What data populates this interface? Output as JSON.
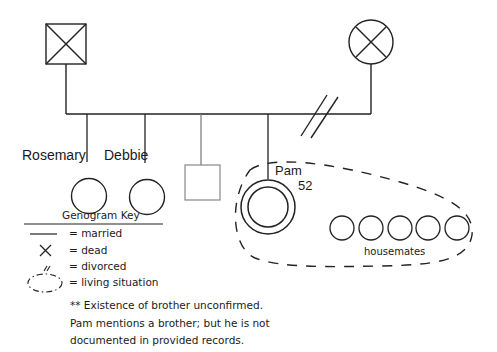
{
  "diagram": {
    "type": "genogram",
    "parents": {
      "father": {
        "symbol": "square-x",
        "status": "dead"
      },
      "mother": {
        "symbol": "circle-x",
        "status": "dead"
      },
      "relationship": "divorced"
    },
    "children": [
      {
        "name": "Rosemary",
        "symbol": "circle"
      },
      {
        "name": "Debbie",
        "symbol": "circle"
      },
      {
        "name": "",
        "symbol": "square",
        "note": "unconfirmed brother"
      },
      {
        "name": "Pam",
        "age": "52",
        "symbol": "double-circle"
      }
    ],
    "housemates": {
      "count": 5,
      "label": "housemates"
    }
  },
  "labels": {
    "rosemary": "Rosemary",
    "debbie": "Debbie",
    "pam": "Pam",
    "pam_age": "52",
    "housemates": "housemates"
  },
  "key": {
    "title": "Genogram Key",
    "items": [
      {
        "symbol": "line",
        "label": "= married"
      },
      {
        "symbol": "x",
        "label": "= dead"
      },
      {
        "symbol": "double-slash",
        "label": "= divorced"
      },
      {
        "symbol": "dashed-ellipse",
        "label": "= living situation"
      }
    ],
    "note_lines": [
      "** Existence of brother unconfirmed.",
      "Pam mentions a brother; but he is not",
      "documented in provided records."
    ]
  }
}
